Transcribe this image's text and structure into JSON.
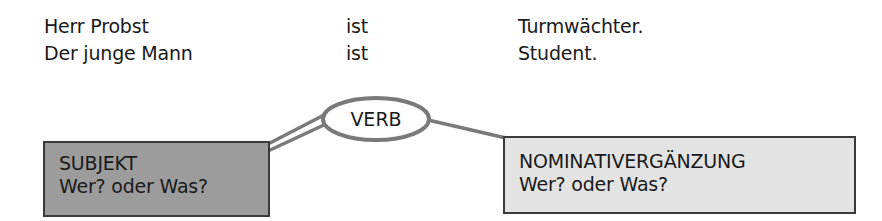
{
  "sentences": [
    {
      "subject": "Herr Probst",
      "verb": "ist",
      "complement": "Turmwächter."
    },
    {
      "subject": "Der junge Mann",
      "verb": "ist",
      "complement": "Student."
    }
  ],
  "diagram": {
    "verb": {
      "label": "VERB"
    },
    "subject_box": {
      "title": "SUBJEKT",
      "question": "Wer? oder Was?",
      "fill": "#9c9c9c"
    },
    "complement_box": {
      "title": "NOMINATIVERGÄNZUNG",
      "question": "Wer? oder Was?",
      "fill": "#e3e3e3"
    },
    "line_color": "#7a7a7a"
  }
}
